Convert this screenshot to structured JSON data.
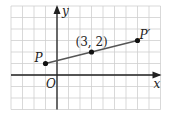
{
  "figure": {
    "type": "coordinate-plane",
    "grid": {
      "x_min": -4,
      "x_max": 9,
      "y_min": -3,
      "y_max": 6,
      "unit_px": 11.5,
      "origin_px": [
        57,
        75
      ],
      "line_color": "#cfcfcf"
    },
    "axes": {
      "x_label": "x",
      "y_label": "y",
      "origin_label": "O",
      "color": "#222222"
    },
    "points": [
      {
        "id": "P",
        "label": "P",
        "x": -1,
        "y": 1
      },
      {
        "id": "M",
        "label": "(3, 2)",
        "x": 3,
        "y": 2
      },
      {
        "id": "Pprime",
        "label": "P′",
        "x": 7,
        "y": 3
      }
    ],
    "segment": {
      "from": "P",
      "to": "Pprime",
      "color": "#555555"
    }
  },
  "chart_data": {
    "type": "scatter",
    "title": "",
    "xlabel": "x",
    "ylabel": "y",
    "xlim": [
      -4,
      9
    ],
    "ylim": [
      -3,
      6
    ],
    "grid": true,
    "series": [
      {
        "name": "segment PP′",
        "x": [
          -1,
          3,
          7
        ],
        "y": [
          1,
          2,
          3
        ],
        "labels": [
          "P",
          "(3, 2)",
          "P′"
        ]
      }
    ],
    "annotations": [
      "O"
    ]
  }
}
